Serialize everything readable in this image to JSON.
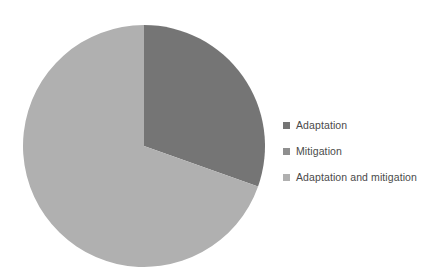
{
  "chart_data": {
    "type": "pie",
    "title": "",
    "xlabel": "",
    "ylabel": "",
    "categories": [
      "Adaptation",
      "Mitigation",
      "Adaptation and mitigation"
    ],
    "values": [
      30.4,
      0,
      69.6
    ],
    "colors": [
      "#757575",
      "#8f8f8f",
      "#b0b0b0"
    ],
    "legend_position": "right",
    "grid": false,
    "start_angle_deg": 0,
    "direction": "clockwise",
    "slices": [
      {
        "label": "Adaptation",
        "value": 30.4,
        "color": "#757575",
        "start_deg": 0,
        "sweep_deg": 109.5
      },
      {
        "label": "Mitigation",
        "value": 0,
        "color": "#8f8f8f",
        "start_deg": 109.5,
        "sweep_deg": 0
      },
      {
        "label": "Adaptation and mitigation",
        "value": 69.6,
        "color": "#b0b0b0",
        "start_deg": 109.5,
        "sweep_deg": 250.5
      }
    ]
  },
  "legend": {
    "items": [
      {
        "label": "Adaptation",
        "color": "#757575",
        "swatch_name": "legend-swatch-adaptation"
      },
      {
        "label": "Mitigation",
        "color": "#8f8f8f",
        "swatch_name": "legend-swatch-mitigation"
      },
      {
        "label": "Adaptation and mitigation",
        "color": "#b0b0b0",
        "swatch_name": "legend-swatch-adaptation-and-mitigation"
      }
    ]
  },
  "figure": {
    "background": "#ffffff",
    "center_x": 122,
    "center_y": 122,
    "radius": 121
  }
}
